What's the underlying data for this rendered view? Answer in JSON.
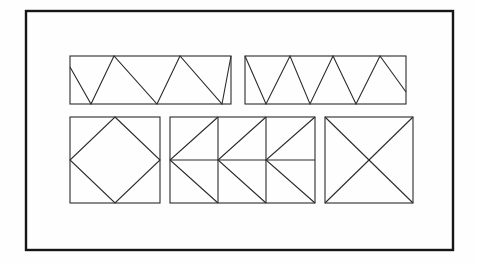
{
  "document": {
    "title": "Geometric tiling figures worksheet",
    "background_color": "#fefefe",
    "ink_color": "#2b2b2b",
    "frame_color": "#161616",
    "canvas": {
      "width": 477,
      "height": 264
    }
  },
  "frame": {
    "name": "outer-border-rectangle",
    "x": 26,
    "y": 11,
    "width": 427,
    "height": 239,
    "stroke_width": 2.4
  },
  "figures": [
    {
      "id": "figure-1",
      "label": "Zigzag band A",
      "shape": "rectangle-with-zigzag",
      "description": "Wide rectangle filled with a descending-first zigzag forming four downward triangles",
      "x": 70,
      "y": 56,
      "width": 161,
      "height": 48,
      "stroke_width": 1.1,
      "polyline": "70,67 91,104 114,56 157,104 180,56 222,104 231,56",
      "vertex_count": 7
    },
    {
      "id": "figure-2",
      "label": "Zigzag band B",
      "shape": "rectangle-with-zigzag",
      "description": "Wide rectangle filled with a zigzag beginning at the top-left corner and ending partway down the right edge",
      "x": 245,
      "y": 56,
      "width": 161,
      "height": 48,
      "stroke_width": 1.1,
      "polyline": "245,56 266,104 290,56 310,104 333,56 356,104 380,56 406,92",
      "vertex_count": 8
    },
    {
      "id": "figure-3",
      "label": "Square with inscribed diamond",
      "shape": "square-with-inscribed-diamond",
      "description": "Square containing a rotated square joining the four edge midpoints",
      "x": 70,
      "y": 117,
      "width": 90,
      "height": 86,
      "stroke_width": 1.1,
      "diamond": "115,117 160,160 115,203 70,160"
    },
    {
      "id": "figure-4",
      "label": "Chevron band",
      "shape": "rectangle-with-chevron-tiling",
      "description": "Wide rectangle divided into three cells with a horizontal midline and left-pointing chevron diagonals",
      "x": 170,
      "y": 117,
      "width": 145,
      "height": 86,
      "stroke_width": 1.1,
      "cells": 3,
      "midline_y": 160,
      "verticals_x": [
        218,
        266
      ],
      "chevrons": [
        "218,117 170,160 218,203",
        "266,117 218,160 266,203",
        "315,117 266,160 315,203"
      ]
    },
    {
      "id": "figure-5",
      "label": "Square with crossed diagonals",
      "shape": "square-with-both-diagonals",
      "description": "Square containing both corner-to-corner diagonals forming an X",
      "x": 325,
      "y": 117,
      "width": 88,
      "height": 86,
      "stroke_width": 1.1,
      "diagonals": [
        "325,117 413,203",
        "413,117 325,203"
      ]
    }
  ]
}
